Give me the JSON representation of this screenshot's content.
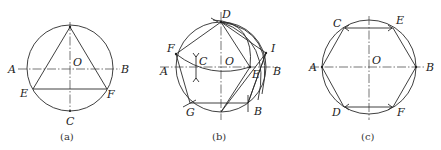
{
  "figures": [
    {
      "id": "a",
      "caption": "(a)",
      "description": "Inscribed equilateral triangle in circle",
      "labels": {
        "A": "A",
        "B": "B",
        "O": "O",
        "E": "E",
        "F": "F",
        "C": "C"
      }
    },
    {
      "id": "b",
      "caption": "(b)",
      "description": "Construction of inscribed regular pentagon",
      "labels": {
        "A": "A",
        "B": "B",
        "C": "C",
        "O": "O",
        "D": "D",
        "E": "E",
        "F": "F",
        "I": "I",
        "G": "G",
        "B2": "B"
      }
    },
    {
      "id": "c",
      "caption": "(c)",
      "description": "Inscribed regular hexagon in circle",
      "labels": {
        "A": "A",
        "B": "B",
        "O": "O",
        "C": "C",
        "E": "E",
        "D": "D",
        "F": "F"
      }
    }
  ],
  "colors": {
    "line": "#2a2a2a",
    "text": "#222222",
    "background": "#ffffff"
  }
}
